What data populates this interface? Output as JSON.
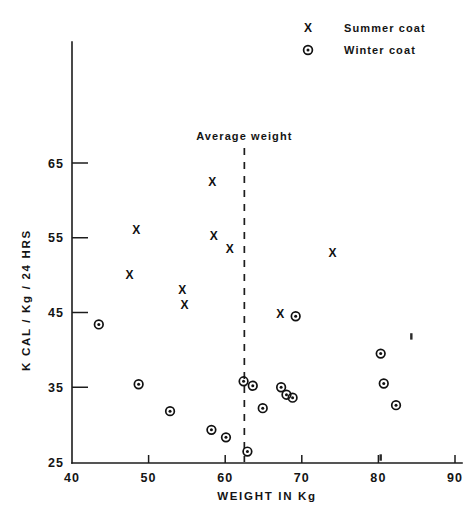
{
  "chart_data": {
    "type": "scatter",
    "title": "",
    "xlabel": "WEIGHT IN Kg",
    "ylabel": "K CAL / Kg / 24 HRS",
    "xlim": [
      40,
      90
    ],
    "ylim": [
      25,
      68
    ],
    "xticks": [
      40,
      50,
      60,
      70,
      80,
      90
    ],
    "yticks": [
      25,
      35,
      45,
      55,
      65
    ],
    "grid": false,
    "legend_position": "top-right",
    "legend": [
      {
        "marker": "x",
        "label": "Summer coat"
      },
      {
        "marker": "o",
        "label": "Winter coat"
      }
    ],
    "annotations": [
      {
        "text": "Average weight",
        "x": 62.5,
        "kind": "vertical-dashed-line",
        "y_top": 67.0,
        "y_bottom": 25.0
      }
    ],
    "series": [
      {
        "name": "Summer coat",
        "marker": "x",
        "points": [
          {
            "x": 48.4,
            "y": 56.0
          },
          {
            "x": 47.5,
            "y": 50.0
          },
          {
            "x": 54.4,
            "y": 48.0
          },
          {
            "x": 54.7,
            "y": 46.0
          },
          {
            "x": 58.3,
            "y": 62.5
          },
          {
            "x": 58.5,
            "y": 55.2
          },
          {
            "x": 60.6,
            "y": 53.5
          },
          {
            "x": 67.2,
            "y": 44.8
          },
          {
            "x": 74.0,
            "y": 53.0
          }
        ]
      },
      {
        "name": "Winter coat",
        "marker": "o",
        "points": [
          {
            "x": 43.5,
            "y": 43.4
          },
          {
            "x": 48.7,
            "y": 35.4
          },
          {
            "x": 52.8,
            "y": 31.8
          },
          {
            "x": 58.2,
            "y": 29.3
          },
          {
            "x": 60.1,
            "y": 28.3
          },
          {
            "x": 62.4,
            "y": 35.8
          },
          {
            "x": 63.6,
            "y": 35.2
          },
          {
            "x": 64.9,
            "y": 32.2
          },
          {
            "x": 62.9,
            "y": 26.4
          },
          {
            "x": 67.3,
            "y": 35.0
          },
          {
            "x": 68.0,
            "y": 34.0
          },
          {
            "x": 68.8,
            "y": 33.6
          },
          {
            "x": 69.2,
            "y": 44.5
          },
          {
            "x": 80.3,
            "y": 39.5
          },
          {
            "x": 80.7,
            "y": 35.5
          },
          {
            "x": 82.3,
            "y": 32.6
          }
        ]
      }
    ],
    "specks": [
      {
        "x": 84.3,
        "y": 41.8
      },
      {
        "x": 80.3,
        "y": 25.6
      }
    ]
  },
  "axes": {
    "x_title": "WEIGHT IN Kg",
    "y_title": "K CAL / Kg / 24 HRS",
    "x_tick_labels": [
      "40",
      "50",
      "60",
      "70",
      "80",
      "90"
    ],
    "y_tick_labels": [
      "25",
      "35",
      "45",
      "55",
      "65"
    ]
  },
  "legend": {
    "summer_marker": "X",
    "summer_label": "Summer coat",
    "winter_marker": "O",
    "winter_label": "Winter coat"
  },
  "annotation": {
    "average_weight_label": "Average  weight"
  },
  "colors": {
    "ink": "#111111",
    "background": "#ffffff"
  }
}
